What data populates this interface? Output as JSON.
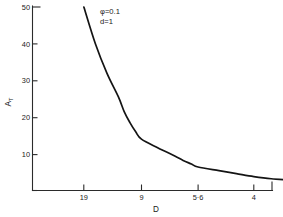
{
  "figure": {
    "background_color": "#ffffff",
    "line_color": "#141414",
    "axis_color": "#2b2b2b"
  },
  "chart_data": {
    "type": "line",
    "title": "",
    "subtitle": "",
    "xlabel": "D",
    "ylabel": "A",
    "ylabel_subscript": "T",
    "ylim": [
      0,
      50
    ],
    "xlim_labels": [
      "19",
      "9",
      "5·6",
      "4"
    ],
    "grid": false,
    "legend": false,
    "legend_position": "none",
    "y_ticks": [
      10,
      20,
      30,
      40,
      50
    ],
    "y_tick_labels": [
      "10",
      "20",
      "30",
      "40",
      "50"
    ],
    "x_ticks": [
      "19",
      "9",
      "5·6",
      "4"
    ],
    "x_tick_labels": [
      "19",
      "9",
      "5·6",
      "4"
    ],
    "x_tick_pixel_fractions": [
      0.214,
      0.454,
      0.69,
      0.922
    ],
    "annotations": [
      {
        "id": "phi",
        "text": "φ=0.1"
      },
      {
        "id": "d",
        "text": "d=1"
      }
    ],
    "series": [
      {
        "name": "A_T",
        "points": [
          {
            "x": "19",
            "y": 50.0
          },
          {
            "x": "17",
            "y": 40.0
          },
          {
            "x": "15",
            "y": 32.0
          },
          {
            "x": "13",
            "y": 25.5
          },
          {
            "x": "12",
            "y": 21.5
          },
          {
            "x": "11",
            "y": 18.5
          },
          {
            "x": "10",
            "y": 16.0
          },
          {
            "x": "9",
            "y": 14.0
          },
          {
            "x": "8",
            "y": 11.6
          },
          {
            "x": "7",
            "y": 9.4
          },
          {
            "x": "6·5",
            "y": 8.2
          },
          {
            "x": "6",
            "y": 7.2
          },
          {
            "x": "5·6",
            "y": 6.4
          },
          {
            "x": "5",
            "y": 5.4
          },
          {
            "x": "4·5",
            "y": 4.6
          },
          {
            "x": "4",
            "y": 3.8
          },
          {
            "x": "3·5",
            "y": 3.2
          },
          {
            "x": "3",
            "y": 2.9
          }
        ]
      }
    ]
  }
}
